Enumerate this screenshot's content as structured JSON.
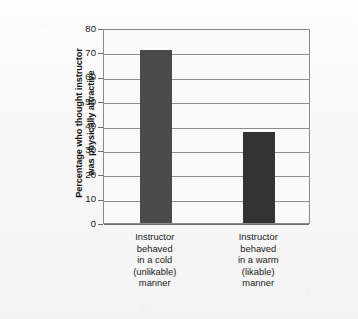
{
  "chart_data": {
    "type": "bar",
    "title": "",
    "subtitle": "",
    "xlabel": "",
    "ylabel": "Percentage who thought instructor was physically attractive",
    "ylabel_lines": [
      "Percentage who thought instructor",
      "was physically attractive"
    ],
    "categories": [
      "Instructor behaved in a cold (unlikable) manner",
      "Instructor behaved in a warm (likable) manner"
    ],
    "category_lines": [
      [
        "Instructor",
        "behaved",
        "in a cold",
        "(unlikable)",
        "manner"
      ],
      [
        "Instructor",
        "behaved",
        "in a warm",
        "(likable)",
        "manner"
      ]
    ],
    "values": [
      71,
      37.5
    ],
    "ylim": [
      0,
      80
    ],
    "yticks": [
      0,
      10,
      20,
      30,
      40,
      50,
      60,
      70,
      80
    ],
    "ytick_labels": [
      "0",
      "10",
      "20",
      "30",
      "40",
      "50",
      "60",
      "70",
      "80"
    ],
    "grid": true,
    "grid_axis": "y",
    "legend": false,
    "legend_position": "none",
    "bar_colors": [
      "#4a4a4a",
      "#333333"
    ],
    "grid_color": "#8d8d8d",
    "frame_color": "#8a8a8a",
    "plot_background": "#fafafa",
    "figure_background": "#f8f8f8"
  }
}
